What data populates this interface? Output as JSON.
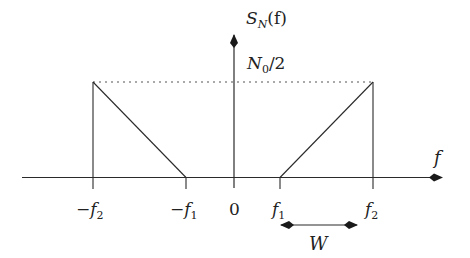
{
  "diagram": {
    "type": "power-spectral-density",
    "colors": {
      "line": "#2a2a2a",
      "dotted": "#555555",
      "background": "#ffffff"
    },
    "y_axis": {
      "label_main": "S",
      "label_sub": "N",
      "label_arg": "(f)"
    },
    "level": {
      "label_main": "N",
      "label_sub": "0",
      "label_rest": "/2"
    },
    "x_axis": {
      "label": "f"
    },
    "ticks": [
      {
        "id": "neg-f2",
        "sign": "−",
        "main": "f",
        "sub": "2"
      },
      {
        "id": "neg-f1",
        "sign": "−",
        "main": "f",
        "sub": "1"
      },
      {
        "id": "zero",
        "sign": "",
        "main": "0",
        "sub": ""
      },
      {
        "id": "f1",
        "sign": "",
        "main": "f",
        "sub": "1"
      },
      {
        "id": "f2",
        "sign": "",
        "main": "f",
        "sub": "2"
      }
    ],
    "bandwidth": {
      "label": "W"
    },
    "shape": {
      "description": "Two mirrored triangles: left triangle from -f2 (height N0/2) falling to -f1; right triangle rising from f1 to f2 (height N0/2)",
      "height": "N0/2"
    }
  }
}
